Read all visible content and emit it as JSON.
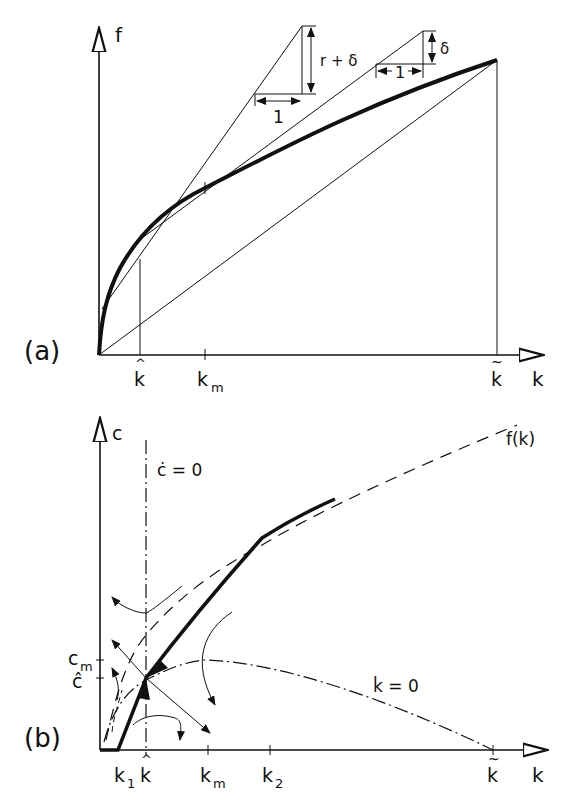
{
  "colors": {
    "ink": "#111111",
    "background": "#ffffff"
  },
  "panel_a": {
    "tag": "(a)",
    "y_axis_label": "f",
    "x_axis_label": "k",
    "x_ticks": {
      "k_hat": "k",
      "k_m": "k",
      "k_m_sub": "m",
      "k_tilde": "k"
    },
    "triangle_1": {
      "vertical": "r + δ",
      "horizontal": "1"
    },
    "triangle_2": {
      "vertical": "δ",
      "horizontal": "1"
    }
  },
  "panel_b": {
    "tag": "(b)",
    "y_axis_label": "c",
    "x_axis_label": "k",
    "curve_label": "f(k)",
    "c_dot_label": "ċ = 0",
    "k_dot_label": "k̇ = 0",
    "y_ticks": {
      "c_m": "c",
      "c_m_sub": "m",
      "c_hat": "ĉ"
    },
    "x_ticks": {
      "k1": "k",
      "k1_sub": "1",
      "k_hat": "k",
      "k_m": "k",
      "k_m_sub": "m",
      "k2": "k",
      "k2_sub": "2",
      "k_tilde": "k"
    }
  }
}
